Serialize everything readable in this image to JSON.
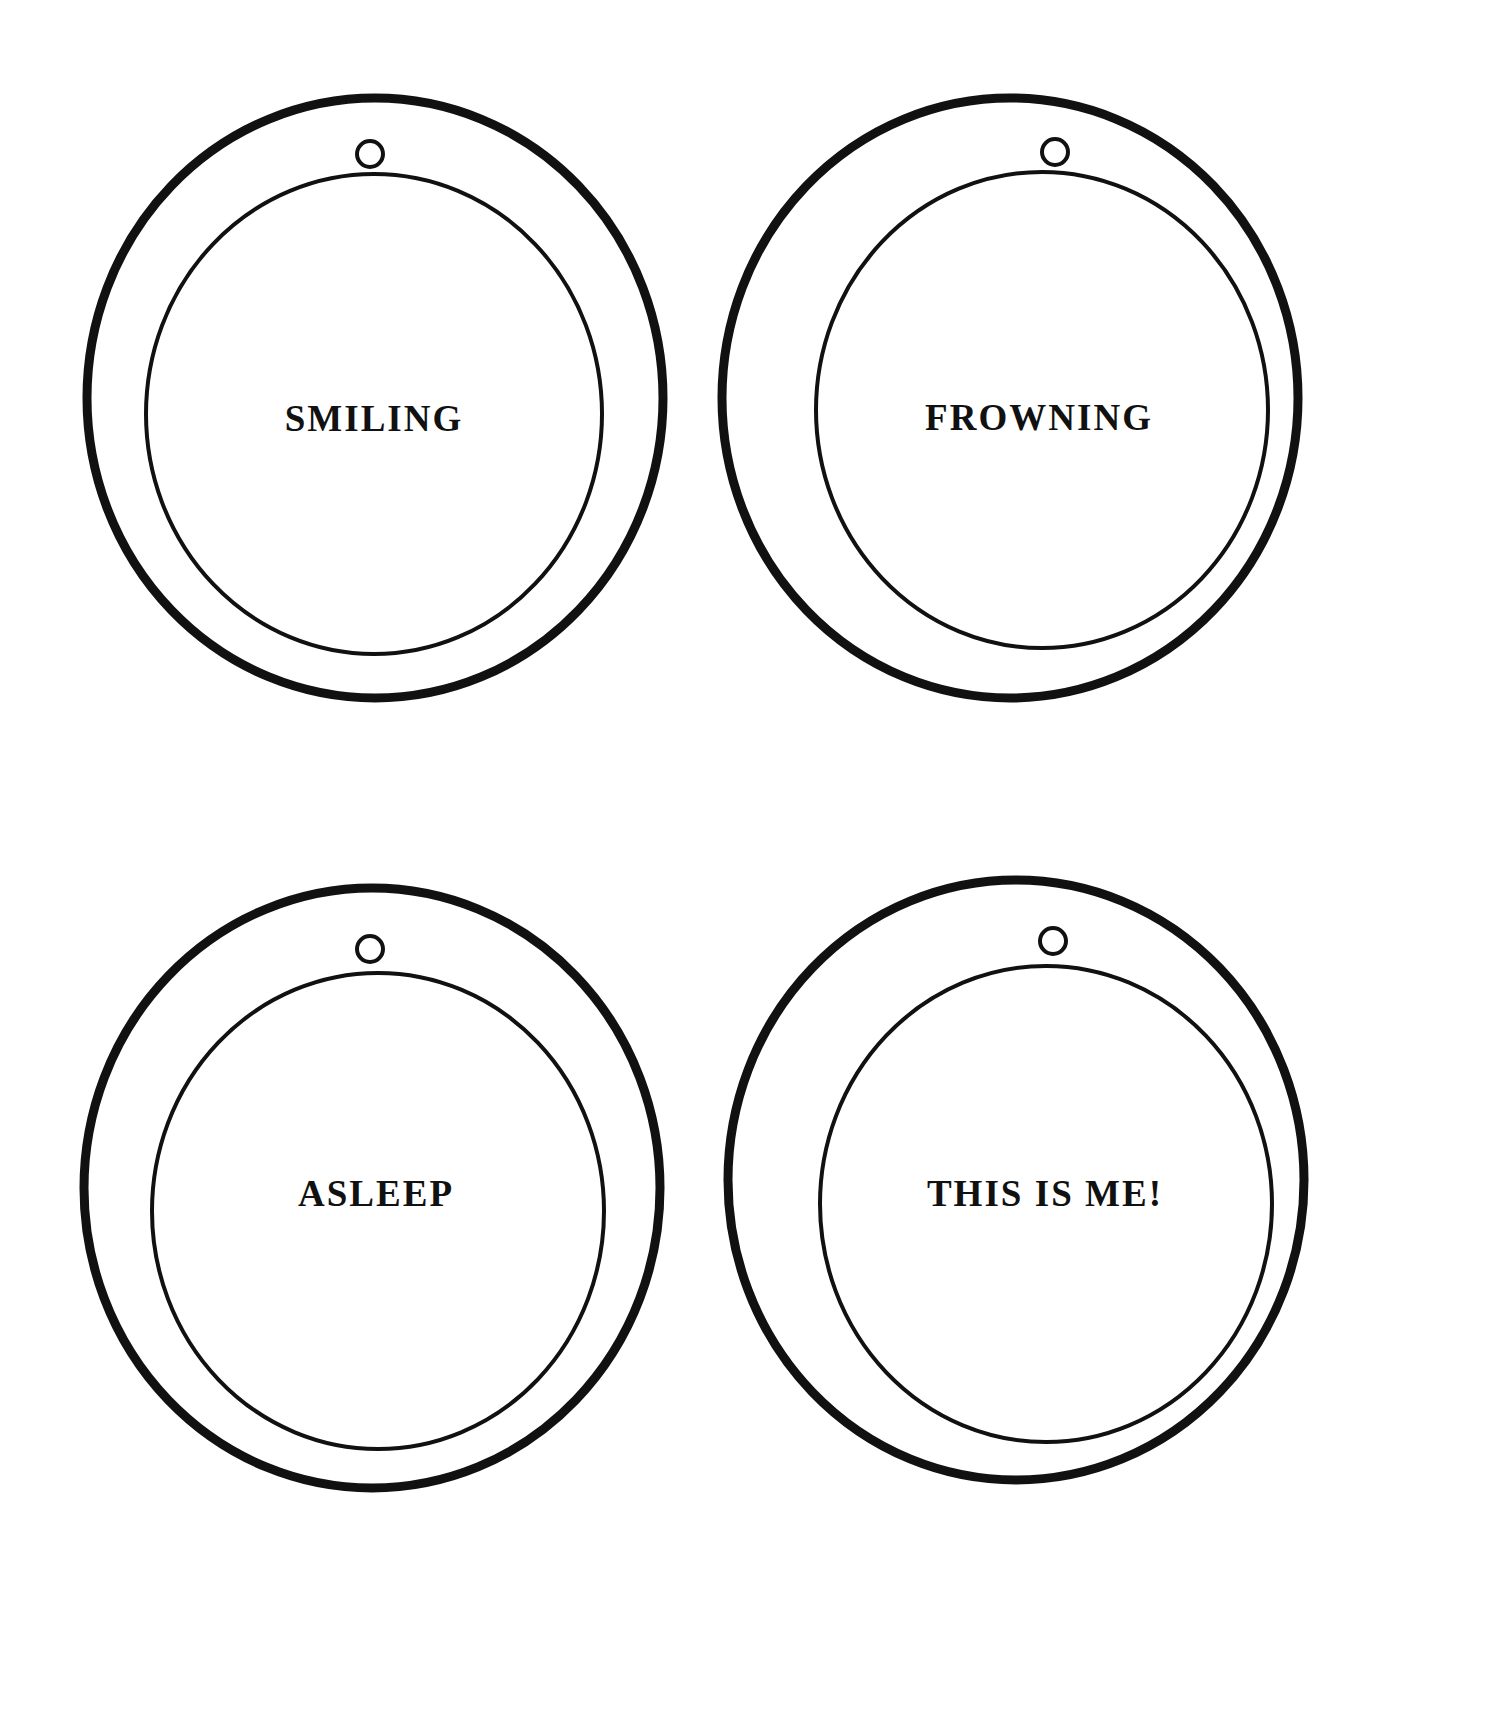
{
  "page": {
    "background_color": "#ffffff",
    "ink_color": "#111111",
    "width": 1509,
    "height": 1731
  },
  "badges": [
    {
      "id": "smiling",
      "label": "SMILING",
      "position": "top-left",
      "outer_circle": {
        "cx": 293,
        "cy": 306,
        "rx": 288,
        "ry": 300,
        "stroke_width": 9
      },
      "inner_circle": {
        "cx": 292,
        "cy": 322,
        "rx": 228,
        "ry": 240,
        "stroke_width": 4
      },
      "hanging_hole": {
        "cx": 288,
        "cy": 62,
        "r": 13,
        "stroke_width": 4
      },
      "label_center": {
        "x": 292,
        "y": 326
      }
    },
    {
      "id": "frowning",
      "label": "FROWNING",
      "position": "top-right",
      "outer_circle": {
        "cx": 268,
        "cy": 306,
        "rx": 288,
        "ry": 300,
        "stroke_width": 9
      },
      "inner_circle": {
        "cx": 300,
        "cy": 318,
        "rx": 226,
        "ry": 238,
        "stroke_width": 4
      },
      "hanging_hole": {
        "cx": 313,
        "cy": 60,
        "r": 13,
        "stroke_width": 4
      },
      "label_center": {
        "x": 297,
        "y": 325
      }
    },
    {
      "id": "asleep",
      "label": "ASLEEP",
      "position": "bottom-left",
      "outer_circle": {
        "cx": 290,
        "cy": 320,
        "rx": 288,
        "ry": 300,
        "stroke_width": 9
      },
      "inner_circle": {
        "cx": 296,
        "cy": 343,
        "rx": 226,
        "ry": 238,
        "stroke_width": 4
      },
      "hanging_hole": {
        "cx": 288,
        "cy": 81,
        "r": 13,
        "stroke_width": 4
      },
      "label_center": {
        "x": 294,
        "y": 325
      }
    },
    {
      "id": "this-is-me",
      "label": "THIS IS ME!",
      "position": "bottom-right",
      "outer_circle": {
        "cx": 274,
        "cy": 312,
        "rx": 288,
        "ry": 300,
        "stroke_width": 9
      },
      "inner_circle": {
        "cx": 304,
        "cy": 336,
        "rx": 226,
        "ry": 238,
        "stroke_width": 4
      },
      "hanging_hole": {
        "cx": 311,
        "cy": 73,
        "r": 13,
        "stroke_width": 4
      },
      "label_center": {
        "x": 303,
        "y": 325
      }
    }
  ]
}
